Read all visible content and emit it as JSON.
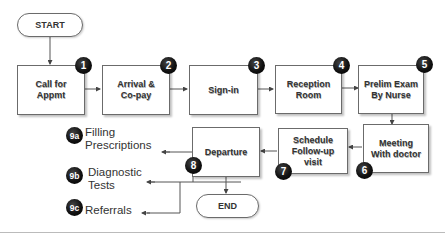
{
  "diagram": {
    "type": "flowchart",
    "start": "START",
    "end": "END",
    "steps": [
      {
        "id": "1",
        "label_line1": "Call for",
        "label_line2": "Appmt"
      },
      {
        "id": "2",
        "label_line1": "Arrival &",
        "label_line2": "Co-pay"
      },
      {
        "id": "3",
        "label_line1": "Sign-in",
        "label_line2": ""
      },
      {
        "id": "4",
        "label_line1": "Reception",
        "label_line2": "Room"
      },
      {
        "id": "5",
        "label_line1": "Prelim Exam",
        "label_line2": "By Nurse"
      },
      {
        "id": "6",
        "label_line1": "Meeting",
        "label_line2": "With doctor"
      },
      {
        "id": "7",
        "label_line1": "Schedule",
        "label_line2": "Follow-up",
        "label_line3": "visit"
      },
      {
        "id": "8",
        "label_line1": "Departure",
        "label_line2": ""
      }
    ],
    "outcomes": [
      {
        "id": "9a",
        "label_line1": "Filling",
        "label_line2": "Prescriptions"
      },
      {
        "id": "9b",
        "label_line1": "Diagnostic",
        "label_line2": "Tests"
      },
      {
        "id": "9c",
        "label_line1": "Referrals",
        "label_line2": ""
      }
    ],
    "colors": {
      "stroke": "#6b6b6b",
      "badge": "#111111",
      "text": "#333333"
    }
  }
}
